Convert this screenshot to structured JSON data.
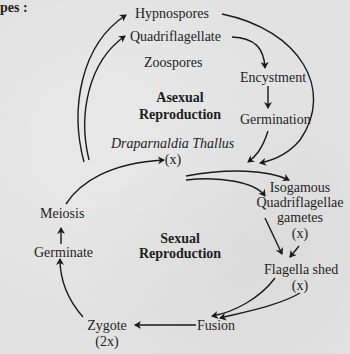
{
  "header_fragment": "pes :",
  "asexual": {
    "title_line1": "Asexual",
    "title_line2": "Reproduction",
    "nodes": {
      "hypnospores": "Hypnospores",
      "quadriflagellate": "Quadriflagellate",
      "zoospores": "Zoospores",
      "encystment": "Encystment",
      "germination": "Germination"
    }
  },
  "thallus": {
    "name": "Draparnaldia Thallus",
    "ploidy": "(x)"
  },
  "sexual": {
    "title_line1": "Sexual",
    "title_line2": "Reproduction",
    "nodes": {
      "gametes_line1": "Isogamous",
      "gametes_line2": "Quadriflagellae",
      "gametes_line3": "gametes",
      "gametes_ploidy": "(x)",
      "flagella_shed": "Flagella shed",
      "flagella_ploidy": "(x)",
      "fusion": "Fusion",
      "zygote": "Zygote",
      "zygote_ploidy": "(2x)",
      "germinate": "Germinate",
      "meiosis": "Meiosis"
    }
  }
}
